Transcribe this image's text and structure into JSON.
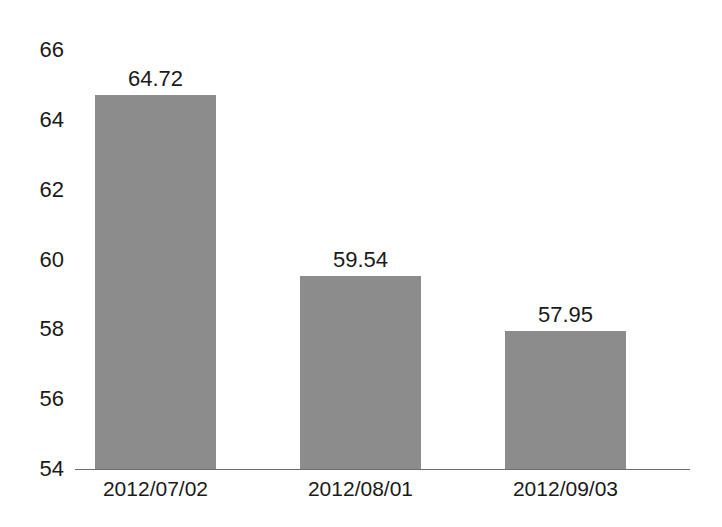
{
  "chart_data": {
    "type": "bar",
    "title": "",
    "subtitle": "",
    "xlabel": "",
    "ylabel": "",
    "categories": [
      "2012/07/02",
      "2012/08/01",
      "2012/09/03"
    ],
    "values": [
      64.72,
      59.54,
      57.95
    ],
    "value_labels": [
      "64.72",
      "59.54",
      "57.95"
    ],
    "ylim": [
      54,
      66
    ],
    "yticks": [
      66,
      64,
      62,
      60,
      58,
      56,
      54
    ],
    "ytick_labels": [
      "66",
      "64",
      "62",
      "60",
      "58",
      "56",
      "54"
    ],
    "grid": false,
    "legend": false,
    "legend_position": "none",
    "series": [
      {
        "name": "",
        "values": [
          64.72,
          59.54,
          57.95
        ]
      }
    ],
    "colors": {
      "bar": "#8c8c8c",
      "axis": "#6e6e6e",
      "text": "#1a1a1a",
      "background": "#ffffff"
    }
  }
}
